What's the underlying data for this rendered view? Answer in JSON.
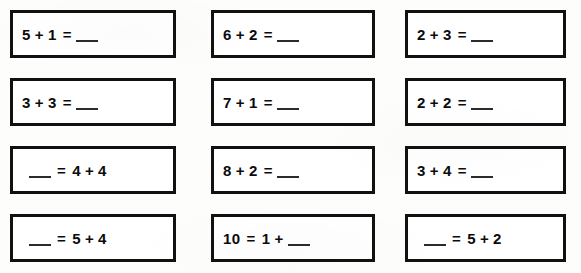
{
  "worksheet": {
    "title": "Addition facts practice worksheet",
    "columns": 3,
    "rows": 4,
    "blank_symbol": "___",
    "border_color": "#111111",
    "text_color": "#0b0b0b",
    "paper_color": "#fdfdfc",
    "problems": [
      {
        "id": "r1c1",
        "text": "5 + 1 = ___",
        "layout": "blank-last",
        "left": "5",
        "operator": "+",
        "right": "1",
        "equals": "=",
        "row": 1,
        "column": 1
      },
      {
        "id": "r1c2",
        "text": "6 + 2 = ___",
        "layout": "blank-last",
        "left": "6",
        "operator": "+",
        "right": "2",
        "equals": "=",
        "row": 1,
        "column": 2
      },
      {
        "id": "r1c3",
        "text": "2 + 3 = ___",
        "layout": "blank-last",
        "left": "2",
        "operator": "+",
        "right": "3",
        "equals": "=",
        "row": 1,
        "column": 3
      },
      {
        "id": "r2c1",
        "text": "3 + 3 = ___",
        "layout": "blank-last",
        "left": "3",
        "operator": "+",
        "right": "3",
        "equals": "=",
        "row": 2,
        "column": 1
      },
      {
        "id": "r2c2",
        "text": "7 + 1 = ___",
        "layout": "blank-last",
        "left": "7",
        "operator": "+",
        "right": "1",
        "equals": "=",
        "row": 2,
        "column": 2
      },
      {
        "id": "r2c3",
        "text": "2 + 2 = ___",
        "layout": "blank-last",
        "left": "2",
        "operator": "+",
        "right": "2",
        "equals": "=",
        "row": 2,
        "column": 3
      },
      {
        "id": "r3c1",
        "text": "___ = 4 + 4",
        "layout": "blank-first",
        "left": "4",
        "operator": "+",
        "right": "4",
        "equals": "=",
        "row": 3,
        "column": 1
      },
      {
        "id": "r3c2",
        "text": "8 + 2 = ___",
        "layout": "blank-last",
        "left": "8",
        "operator": "+",
        "right": "2",
        "equals": "=",
        "row": 3,
        "column": 2
      },
      {
        "id": "r3c3",
        "text": "3 + 4 = ___",
        "layout": "blank-last",
        "left": "3",
        "operator": "+",
        "right": "4",
        "equals": "=",
        "row": 3,
        "column": 3
      },
      {
        "id": "r4c1",
        "text": "___ = 5 + 4",
        "layout": "blank-first",
        "left": "5",
        "operator": "+",
        "right": "4",
        "equals": "=",
        "row": 4,
        "column": 1
      },
      {
        "id": "r4c2",
        "text": "10 = 1 + ___",
        "layout": "sum-first",
        "left": "10",
        "operator": "+",
        "right": "1",
        "equals": "=",
        "row": 4,
        "column": 2
      },
      {
        "id": "r4c3",
        "text": "___ = 5 + 2",
        "layout": "blank-first",
        "left": "5",
        "operator": "+",
        "right": "2",
        "equals": "=",
        "row": 4,
        "column": 3
      }
    ]
  }
}
